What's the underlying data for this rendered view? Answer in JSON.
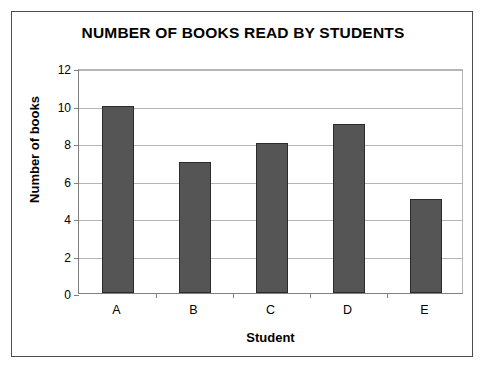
{
  "chart_data": {
    "type": "bar",
    "title": "NUMBER OF BOOKS READ BY STUDENTS",
    "xlabel": "Student",
    "ylabel": "Number of books",
    "categories": [
      "A",
      "B",
      "C",
      "D",
      "E"
    ],
    "values": [
      10,
      7,
      8,
      9,
      5
    ],
    "series": [
      {
        "name": "Number of books",
        "values": [
          10,
          7,
          8,
          9,
          5
        ]
      }
    ],
    "ylim": [
      0,
      12
    ],
    "ytick_labels": [
      "0",
      "2",
      "4",
      "6",
      "8",
      "10",
      "12"
    ],
    "ytick_values": [
      0,
      2,
      4,
      6,
      8,
      10,
      12
    ],
    "grid": "horizontal",
    "legend": "none",
    "colors": {
      "bar_fill": "#555555",
      "bar_border": "#2b2b2b",
      "gridline": "#b5b5b5",
      "axis": "#808080",
      "frame": "#4d4d4d",
      "background": "#ffffff",
      "text": "#000000"
    }
  }
}
